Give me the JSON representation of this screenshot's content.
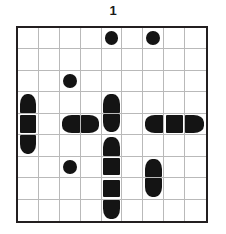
{
  "puzzle": {
    "title": "1",
    "type": "battleship-grid-puzzle",
    "grid": {
      "columns": 9,
      "rows": 9,
      "border_color": "#231f20",
      "gridline_color": "#b9b9b9",
      "background_color": "#ffffff",
      "piece_color": "#141414"
    },
    "pieces": [
      {
        "row": 0,
        "col": 4,
        "shape": "circle",
        "name": "ship-single-r0c4"
      },
      {
        "row": 0,
        "col": 6,
        "shape": "circle",
        "name": "ship-single-r0c6"
      },
      {
        "row": 2,
        "col": 2,
        "shape": "circle",
        "name": "ship-single-r2c2"
      },
      {
        "row": 3,
        "col": 0,
        "shape": "cap-top",
        "name": "ship-vertical3-top-r3c0"
      },
      {
        "row": 4,
        "col": 0,
        "shape": "middle",
        "name": "ship-vertical3-middle-r4c0"
      },
      {
        "row": 5,
        "col": 0,
        "shape": "cap-bottom",
        "name": "ship-vertical3-bottom-r5c0"
      },
      {
        "row": 3,
        "col": 4,
        "shape": "cap-top",
        "name": "ship-vertical2-top-r3c4"
      },
      {
        "row": 4,
        "col": 4,
        "shape": "cap-bottom",
        "name": "ship-vertical2-bottom-r4c4"
      },
      {
        "row": 4,
        "col": 2,
        "shape": "cap-left",
        "name": "ship-horizontal2-left-r4c2"
      },
      {
        "row": 4,
        "col": 3,
        "shape": "cap-right",
        "name": "ship-horizontal2-right-r4c3"
      },
      {
        "row": 4,
        "col": 6,
        "shape": "cap-left",
        "name": "ship-horizontal3-left-r4c6"
      },
      {
        "row": 4,
        "col": 7,
        "shape": "middle",
        "name": "ship-horizontal3-middle-r4c7"
      },
      {
        "row": 4,
        "col": 8,
        "shape": "cap-right",
        "name": "ship-horizontal3-right-r4c8"
      },
      {
        "row": 5,
        "col": 4,
        "shape": "cap-top",
        "name": "ship-vertical4-top-r5c4"
      },
      {
        "row": 6,
        "col": 4,
        "shape": "middle",
        "name": "ship-vertical4-middle-r6c4"
      },
      {
        "row": 7,
        "col": 4,
        "shape": "middle",
        "name": "ship-vertical4-middle-r7c4"
      },
      {
        "row": 8,
        "col": 4,
        "shape": "cap-bottom",
        "name": "ship-vertical4-bottom-r8c4"
      },
      {
        "row": 6,
        "col": 2,
        "shape": "circle",
        "name": "ship-single-r6c2"
      },
      {
        "row": 6,
        "col": 6,
        "shape": "cap-top",
        "name": "ship-vertical2-top-r6c6"
      },
      {
        "row": 7,
        "col": 6,
        "shape": "cap-bottom",
        "name": "ship-vertical2-bottom-r7c6"
      }
    ]
  }
}
